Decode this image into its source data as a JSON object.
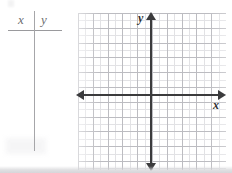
{
  "worksheet": {
    "table": {
      "name": "xy-value-table",
      "headers": [
        "x",
        "y"
      ],
      "rows": [],
      "row_count": 0,
      "divider_color": "#a6a6a9",
      "rule_color": "#9a9a9d"
    },
    "graph": {
      "name": "blank-coordinate-plane",
      "axis_labels": {
        "x": "x",
        "y": "y"
      },
      "axis_color": "#3b3b3d",
      "grid_minor_color": "#e2e2e5",
      "grid_major_color": "#bcbcc1",
      "icons": {
        "arrow_left": "arrow-left-icon",
        "arrow_right": "arrow-right-icon",
        "arrow_up": "arrow-up-icon",
        "arrow_down": "arrow-down-icon"
      },
      "plotted_points": [],
      "plotted_curves": []
    }
  },
  "chart_data": {
    "type": "scatter",
    "title": "",
    "subtitle": "",
    "xlabel": "x",
    "ylabel": "y",
    "xlim": [
      -9.5,
      9.5
    ],
    "ylim": [
      -9.5,
      10.5
    ],
    "xticks": [],
    "yticks": [],
    "grid": true,
    "grid_minor_spacing": 1,
    "grid_major_spacing": 2,
    "legend": null,
    "legend_position": "none",
    "series": [],
    "annotations": [],
    "note": "Blank coordinate plane with four directional arrows; no data plotted. Companion empty two-column table with headers x and y."
  }
}
